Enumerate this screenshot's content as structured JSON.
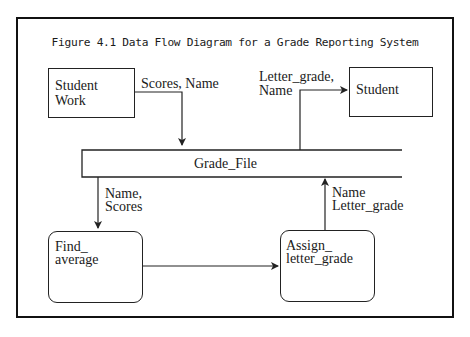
{
  "figure": {
    "caption": "Figure 4.1  Data Flow Diagram for a Grade Reporting System"
  },
  "external_entities": {
    "student_work": {
      "line1": "Student",
      "line2": "Work"
    },
    "student": {
      "label": "Student"
    }
  },
  "data_store": {
    "label": "Grade_File"
  },
  "processes": {
    "find_average": {
      "line1": "Find_",
      "line2": "average"
    },
    "assign_letter_grade": {
      "line1": "Assign_",
      "line2": "letter_grade"
    }
  },
  "flows": {
    "work_to_store": {
      "label": "Scores, Name"
    },
    "store_to_student": {
      "line1": "Letter_grade,",
      "line2": "Name"
    },
    "store_to_find": {
      "line1": "Name,",
      "line2": "Scores"
    },
    "assign_to_store": {
      "line1": "Name",
      "line2": "Letter_grade"
    }
  }
}
